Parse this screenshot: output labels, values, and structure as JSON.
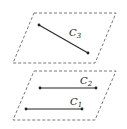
{
  "diagram": {
    "planes": [
      {
        "name": "upper-plane"
      },
      {
        "name": "lower-plane"
      }
    ],
    "curves": [
      {
        "label": "C",
        "sub": "3",
        "plane": "upper"
      },
      {
        "label": "C",
        "sub": "2",
        "plane": "lower"
      },
      {
        "label": "C",
        "sub": "1",
        "plane": "lower"
      }
    ],
    "colors": {
      "stroke": "#222222",
      "dash": "#555555"
    }
  }
}
